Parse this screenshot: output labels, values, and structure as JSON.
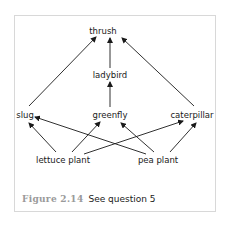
{
  "diagram": {
    "type": "food-web",
    "nodes": [
      {
        "id": "thrush",
        "label": "thrush",
        "x": 103,
        "y": 31
      },
      {
        "id": "ladybird",
        "label": "ladybird",
        "x": 110,
        "y": 75
      },
      {
        "id": "slug",
        "label": "slug",
        "x": 25,
        "y": 115
      },
      {
        "id": "greenfly",
        "label": "greenfly",
        "x": 110,
        "y": 115
      },
      {
        "id": "caterpillar",
        "label": "caterpillar",
        "x": 192,
        "y": 115
      },
      {
        "id": "lettuce_plant",
        "label": "lettuce plant",
        "x": 63,
        "y": 160
      },
      {
        "id": "pea_plant",
        "label": "pea plant",
        "x": 158,
        "y": 160
      }
    ],
    "edges": [
      {
        "from": "slug",
        "to": "thrush"
      },
      {
        "from": "ladybird",
        "to": "thrush"
      },
      {
        "from": "caterpillar",
        "to": "thrush"
      },
      {
        "from": "greenfly",
        "to": "ladybird"
      },
      {
        "from": "lettuce_plant",
        "to": "slug"
      },
      {
        "from": "lettuce_plant",
        "to": "greenfly"
      },
      {
        "from": "lettuce_plant",
        "to": "caterpillar"
      },
      {
        "from": "pea_plant",
        "to": "slug"
      },
      {
        "from": "pea_plant",
        "to": "greenfly"
      },
      {
        "from": "pea_plant",
        "to": "caterpillar"
      }
    ],
    "colors": {
      "arrow": "#1a1a1a",
      "frame_border": "#d8d8d8",
      "caption_number": "#9a9a9a"
    }
  },
  "labels": {
    "thrush": "thrush",
    "ladybird": "ladybird",
    "slug": "slug",
    "greenfly": "greenfly",
    "caterpillar": "caterpillar",
    "lettuce_plant": "lettuce plant",
    "pea_plant": "pea plant"
  },
  "caption": {
    "figure_number": "Figure 2.14",
    "text": "See question 5"
  }
}
